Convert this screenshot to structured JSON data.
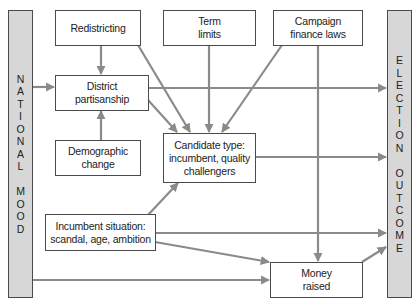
{
  "diagram": {
    "colors": {
      "arrow": "#8a8a8a",
      "box_border": "#4a4a4a",
      "bar_fill": "#d7d7d7"
    },
    "left_bar": {
      "label": "NATIONAL MOOD",
      "words": [
        "NATIONAL",
        "MOOD"
      ]
    },
    "right_bar": {
      "label": "ELECTION OUTCOME",
      "words": [
        "ELECTION",
        "OUTCOME"
      ]
    },
    "nodes": {
      "redistricting": "Redistricting",
      "term_limits": "Term\nlimits",
      "campaign_finance": "Campaign\nfinance laws",
      "district_partisanship": "District\npartisanship",
      "demographic_change": "Demographic\nchange",
      "candidate_type": "Candidate type:\nincumbent, quality\nchallengers",
      "incumbent_situation": "Incumbent situation:\nscandal, age, ambition",
      "money_raised": "Money\nraised"
    },
    "edges": [
      [
        "national_mood",
        "district_partisanship"
      ],
      [
        "national_mood",
        "money_raised"
      ],
      [
        "redistricting",
        "district_partisanship"
      ],
      [
        "redistricting",
        "candidate_type"
      ],
      [
        "term_limits",
        "candidate_type"
      ],
      [
        "campaign_finance",
        "candidate_type"
      ],
      [
        "campaign_finance",
        "money_raised"
      ],
      [
        "demographic_change",
        "district_partisanship"
      ],
      [
        "district_partisanship",
        "candidate_type"
      ],
      [
        "district_partisanship",
        "election_outcome"
      ],
      [
        "candidate_type",
        "election_outcome"
      ],
      [
        "incumbent_situation",
        "candidate_type"
      ],
      [
        "incumbent_situation",
        "election_outcome"
      ],
      [
        "incumbent_situation",
        "money_raised"
      ],
      [
        "money_raised",
        "election_outcome"
      ]
    ]
  }
}
